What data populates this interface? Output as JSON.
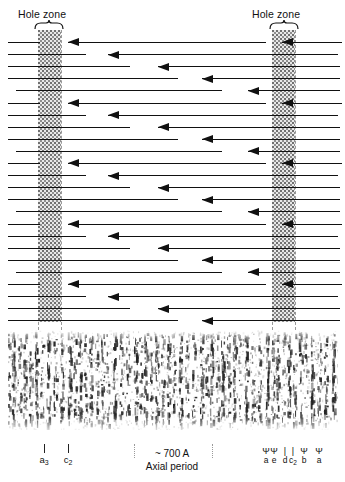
{
  "figure": {
    "width": 345,
    "height": 482,
    "background": "#ffffff",
    "ink_color": "#111111",
    "guide_color": "#9a9a9a",
    "hole_zone_fill": "#e8e8e8"
  },
  "hole_zones": [
    {
      "label": "Hole zone",
      "label_x": 18,
      "label_y": 8,
      "brace_x": 34,
      "brace_y": 20,
      "brace_width": 30,
      "box_x": 38,
      "box_y": 30,
      "box_width": 23,
      "box_height": 292,
      "guide_left_x": 38,
      "guide_right_x": 61
    },
    {
      "label": "Hole zone",
      "label_x": 252,
      "label_y": 8,
      "brace_x": 269,
      "brace_y": 20,
      "brace_width": 30,
      "box_x": 272,
      "box_y": 30,
      "box_width": 23,
      "box_height": 292,
      "guide_left_x": 272,
      "guide_right_x": 295
    }
  ],
  "diagram": {
    "top": 30,
    "bottom": 322,
    "row_spacing": 12.1,
    "row_start_y": 42,
    "row_count": 24,
    "arrow_direction": "left",
    "note": "Each row is one staggered collagen molecule drawn as a left-pointing arrow; pattern repeats every 5 rows creating the quarter-stagger D-period array.",
    "rows": [
      {
        "segments": [
          {
            "x": 8,
            "w": 32
          },
          {
            "x": 68,
            "w": 198,
            "head": true
          }
        ],
        "heads": [
          {
            "x": 282,
            "w": 60,
            "head": true
          }
        ]
      },
      {
        "segments": [
          {
            "x": 8,
            "w": 78
          }
        ],
        "heads": [
          {
            "x": 108,
            "w": 230,
            "head": true
          }
        ]
      },
      {
        "segments": [
          {
            "x": 8,
            "w": 122
          }
        ],
        "heads": [
          {
            "x": 158,
            "w": 182,
            "head": true
          }
        ]
      },
      {
        "segments": [
          {
            "x": 8,
            "w": 170
          }
        ],
        "heads": [
          {
            "x": 202,
            "w": 138,
            "head": true
          }
        ]
      },
      {
        "segments": [
          {
            "x": 16,
            "w": 206
          }
        ],
        "heads": [
          {
            "x": 248,
            "w": 92,
            "head": true
          }
        ]
      },
      {
        "segments": [
          {
            "x": 8,
            "w": 32
          },
          {
            "x": 68,
            "w": 198,
            "head": true
          }
        ],
        "heads": [
          {
            "x": 282,
            "w": 60,
            "head": true
          }
        ]
      },
      {
        "segments": [
          {
            "x": 8,
            "w": 78
          }
        ],
        "heads": [
          {
            "x": 108,
            "w": 230,
            "head": true
          }
        ]
      },
      {
        "segments": [
          {
            "x": 8,
            "w": 122
          }
        ],
        "heads": [
          {
            "x": 158,
            "w": 182,
            "head": true
          }
        ]
      },
      {
        "segments": [
          {
            "x": 8,
            "w": 170
          }
        ],
        "heads": [
          {
            "x": 202,
            "w": 138,
            "head": true
          }
        ]
      },
      {
        "segments": [
          {
            "x": 16,
            "w": 206
          }
        ],
        "heads": [
          {
            "x": 248,
            "w": 92,
            "head": true
          }
        ]
      },
      {
        "segments": [
          {
            "x": 8,
            "w": 32
          },
          {
            "x": 68,
            "w": 198,
            "head": true
          }
        ],
        "heads": [
          {
            "x": 282,
            "w": 60,
            "head": true
          }
        ]
      },
      {
        "segments": [
          {
            "x": 8,
            "w": 78
          }
        ],
        "heads": [
          {
            "x": 108,
            "w": 230,
            "head": true
          }
        ]
      },
      {
        "segments": [
          {
            "x": 8,
            "w": 122
          }
        ],
        "heads": [
          {
            "x": 158,
            "w": 182,
            "head": true
          }
        ]
      },
      {
        "segments": [
          {
            "x": 8,
            "w": 170
          }
        ],
        "heads": [
          {
            "x": 202,
            "w": 138,
            "head": true
          }
        ]
      },
      {
        "segments": [
          {
            "x": 16,
            "w": 206
          }
        ],
        "heads": [
          {
            "x": 248,
            "w": 92,
            "head": true
          }
        ]
      },
      {
        "segments": [
          {
            "x": 8,
            "w": 32
          },
          {
            "x": 68,
            "w": 198,
            "head": true
          }
        ],
        "heads": [
          {
            "x": 282,
            "w": 60,
            "head": true
          }
        ]
      },
      {
        "segments": [
          {
            "x": 8,
            "w": 78
          }
        ],
        "heads": [
          {
            "x": 108,
            "w": 230,
            "head": true
          }
        ]
      },
      {
        "segments": [
          {
            "x": 8,
            "w": 122
          }
        ],
        "heads": [
          {
            "x": 158,
            "w": 182,
            "head": true
          }
        ]
      },
      {
        "segments": [
          {
            "x": 8,
            "w": 170
          }
        ],
        "heads": [
          {
            "x": 202,
            "w": 138,
            "head": true
          }
        ]
      },
      {
        "segments": [
          {
            "x": 16,
            "w": 206
          }
        ],
        "heads": [
          {
            "x": 248,
            "w": 92,
            "head": true
          }
        ]
      },
      {
        "segments": [
          {
            "x": 8,
            "w": 32
          },
          {
            "x": 68,
            "w": 198,
            "head": true
          }
        ],
        "heads": [
          {
            "x": 282,
            "w": 60,
            "head": true
          }
        ]
      },
      {
        "segments": [
          {
            "x": 8,
            "w": 78
          }
        ],
        "heads": [
          {
            "x": 108,
            "w": 230,
            "head": true
          }
        ]
      },
      {
        "segments": [
          {
            "x": 8,
            "w": 122
          }
        ],
        "heads": [
          {
            "x": 158,
            "w": 182,
            "head": true
          }
        ]
      },
      {
        "segments": [
          {
            "x": 8,
            "w": 170
          }
        ],
        "heads": [
          {
            "x": 202,
            "w": 138,
            "head": true
          }
        ]
      }
    ]
  },
  "micrograph": {
    "x": 8,
    "y": 330,
    "width": 330,
    "height": 100,
    "description": "Electron micrograph of negatively stained collagen fibril showing dark vertical cross-striation bands"
  },
  "annotations": {
    "left_ticks": [
      {
        "label": "a",
        "sub": "3",
        "x": 44
      },
      {
        "label": "c",
        "sub": "2",
        "x": 68
      }
    ],
    "center": {
      "period_text": "~ 700 A",
      "caption_text": "Axial period",
      "x": 126,
      "y": 447,
      "width": 92,
      "dot_left_x": 134,
      "dot_right_x": 212,
      "dot_y": 444,
      "dot_height": 14
    },
    "right_markers": [
      {
        "glyph": "Ψ",
        "label": "a",
        "sub": "",
        "x": 266
      },
      {
        "glyph": "Ψ",
        "label": "e",
        "sub": "",
        "x": 274
      },
      {
        "glyph": "|",
        "label": "d",
        "sub": "",
        "x": 285
      },
      {
        "glyph": "|",
        "label": "c",
        "sub": "2",
        "x": 293
      },
      {
        "glyph": "Ψ",
        "label": "b",
        "sub": "",
        "x": 304
      },
      {
        "glyph": "Ψ",
        "label": "a",
        "sub": "",
        "x": 319
      }
    ],
    "right_marker_y": 447
  }
}
